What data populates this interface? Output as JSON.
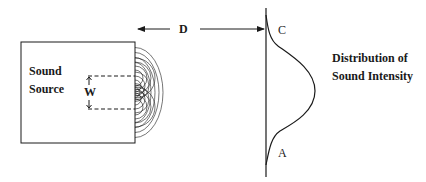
{
  "diagram": {
    "source_label_line1": "Sound",
    "source_label_line2": "Source",
    "aperture_label": "W",
    "distance_label": "D",
    "top_point_label": "C",
    "bottom_point_label": "A",
    "distribution_label_line1": "Distribution of",
    "distribution_label_line2": "Sound Intensity",
    "colors": {
      "stroke": "#1a1a1a",
      "background": "#ffffff"
    }
  }
}
